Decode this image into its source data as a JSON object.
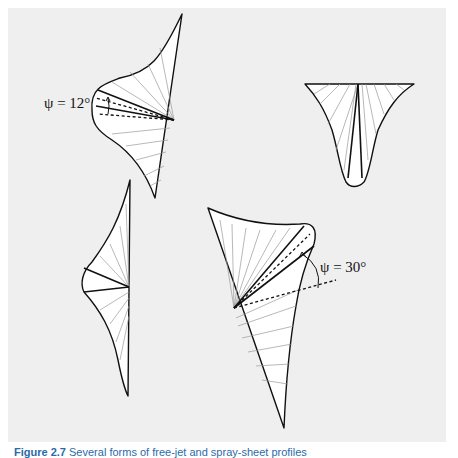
{
  "figure": {
    "caption_number": "Figure 2.7",
    "caption_text": "Several forms of free-jet and spray-sheet profiles",
    "background_color": "#efefef",
    "line_color": "#111111",
    "shapes": [
      {
        "id": "top-left-profile",
        "annotation": "ψ = 12°",
        "angle_deg": 12
      },
      {
        "id": "top-right-profile",
        "annotation": ""
      },
      {
        "id": "mid-left-profile",
        "annotation": ""
      },
      {
        "id": "bottom-center-profile",
        "annotation": "ψ = 30°",
        "angle_deg": 30
      }
    ]
  }
}
